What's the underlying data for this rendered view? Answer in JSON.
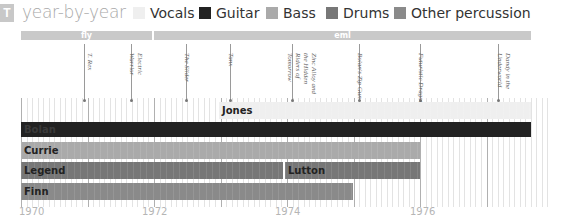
{
  "header": {
    "logo_glyph": "T",
    "title": "year-by-year"
  },
  "legend": [
    {
      "label": "Vocals",
      "color": "#efefef"
    },
    {
      "label": "Guitar",
      "color": "#222222"
    },
    {
      "label": "Bass",
      "color": "#aaaaaa"
    },
    {
      "label": "Drums",
      "color": "#777777"
    },
    {
      "label": "Other percussion",
      "color": "#8a8a8a"
    }
  ],
  "labels_band": [
    {
      "label": "fly",
      "start": 1970.0,
      "end": 1972.0
    },
    {
      "label": "eml",
      "start": 1972.05,
      "end": 1977.7
    }
  ],
  "albums": [
    {
      "title": "T. Rex",
      "year": 1970.95
    },
    {
      "title": "Electric Warrior",
      "year": 1971.7
    },
    {
      "title": "The Slider",
      "year": 1972.55
    },
    {
      "title": "Tanx",
      "year": 1973.2
    },
    {
      "title": "Zinc Alloy and the Hidden Riders of Tomorrow",
      "year": 1974.0
    },
    {
      "title": "Bolan's Zip Gun",
      "year": 1975.0
    },
    {
      "title": "Futuristic Dragon",
      "year": 1975.9
    },
    {
      "title": "Dandy in the Underworld",
      "year": 1977.1
    }
  ],
  "axis": {
    "ticks": [
      "1970",
      "1972",
      "1974",
      "1976"
    ]
  },
  "chart_data": {
    "type": "timeline",
    "title": "year-by-year",
    "xlabel": "",
    "ylabel": "",
    "xlim": [
      1970,
      1978.2
    ],
    "legend_position": "top",
    "grid": true,
    "categories": [
      "Vocals",
      "Guitar",
      "Bass",
      "Drums",
      "Other percussion"
    ],
    "series": [
      {
        "name": "Vocals",
        "member": "Jones",
        "start": 1973.0,
        "end": 1977.7,
        "row": 0
      },
      {
        "name": "Guitar",
        "member": "Bolan",
        "start": 1970.0,
        "end": 1977.7,
        "row": 1
      },
      {
        "name": "Bass",
        "member": "Currie",
        "start": 1970.0,
        "end": 1976.0,
        "row": 2
      },
      {
        "name": "Drums",
        "member": "Legend",
        "start": 1970.0,
        "end": 1973.95,
        "row": 3
      },
      {
        "name": "Drums",
        "member": "Lutton",
        "start": 1974.0,
        "end": 1976.0,
        "row": 3
      },
      {
        "name": "Other percussion",
        "member": "Finn",
        "start": 1970.0,
        "end": 1975.0,
        "row": 4
      }
    ],
    "labels": [
      {
        "label": "fly",
        "start": 1970.0,
        "end": 1972.0
      },
      {
        "label": "eml",
        "start": 1972.05,
        "end": 1977.7
      }
    ],
    "albums": [
      {
        "title": "T. Rex",
        "year": 1970.95
      },
      {
        "title": "Electric Warrior",
        "year": 1971.7
      },
      {
        "title": "The Slider",
        "year": 1972.55
      },
      {
        "title": "Tanx",
        "year": 1973.2
      },
      {
        "title": "Zinc Alloy and the Hidden Riders of Tomorrow",
        "year": 1974.0
      },
      {
        "title": "Bolan's Zip Gun",
        "year": 1975.0
      },
      {
        "title": "Futuristic Dragon",
        "year": 1975.9
      },
      {
        "title": "Dandy in the Underworld",
        "year": 1977.1
      }
    ],
    "tick_labels": [
      "1970",
      "1972",
      "1974",
      "1976"
    ]
  }
}
